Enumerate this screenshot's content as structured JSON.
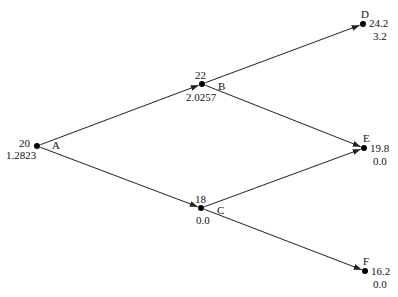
{
  "diagram": {
    "type": "binomial-tree",
    "nodes": {
      "A": {
        "name": "A",
        "price": "20",
        "value": "1.2823",
        "x": 37,
        "y": 146
      },
      "B": {
        "name": "B",
        "price": "22",
        "value": "2.0257",
        "x": 202,
        "y": 84
      },
      "C": {
        "name": "C",
        "price": "18",
        "value": "0.0",
        "x": 201,
        "y": 208
      },
      "D": {
        "name": "D",
        "price": "24.2",
        "value": "3.2",
        "x": 363,
        "y": 24
      },
      "E": {
        "name": "E",
        "price": "19.8",
        "value": "0.0",
        "x": 364,
        "y": 148
      },
      "F": {
        "name": "F",
        "price": "16.2",
        "value": "0.0",
        "x": 365,
        "y": 271
      }
    },
    "edges": [
      {
        "from": "A",
        "to": "B"
      },
      {
        "from": "A",
        "to": "C"
      },
      {
        "from": "B",
        "to": "D"
      },
      {
        "from": "B",
        "to": "E"
      },
      {
        "from": "C",
        "to": "E"
      },
      {
        "from": "C",
        "to": "F"
      }
    ],
    "colors": {
      "line": "#222222",
      "node": "#000000",
      "text": "#111111"
    }
  }
}
